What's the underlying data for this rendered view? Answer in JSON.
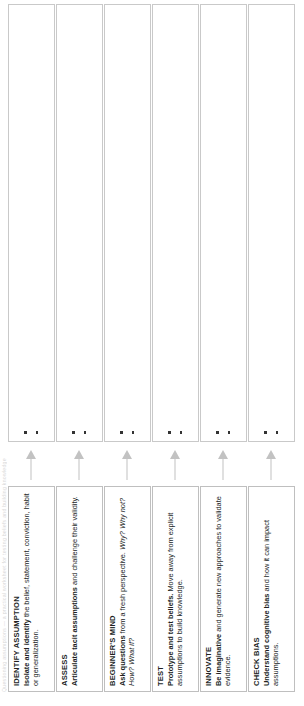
{
  "document": {
    "running_head": "Questioning assumptions — a practical worksheet for testing beliefs and building knowledge",
    "orientation_note": "rotated"
  },
  "steps": [
    {
      "id": "identify-assumption",
      "title": "IDENTIFY ASSUMPTION",
      "lead": "Isolate and identify",
      "body": " the belief, statement, conviction, habit or generalization.",
      "italic": "",
      "marker_count": 2
    },
    {
      "id": "assess",
      "title": "ASSESS",
      "lead": "Articulate tacit assumptions",
      "body": " and challenge their validity.",
      "italic": "",
      "marker_count": 2
    },
    {
      "id": "beginners-mind",
      "title": "BEGINNER'S MIND",
      "lead": "Ask questions",
      "body": " from a fresh perspective.",
      "italic": "Why? Why not? How? What if?",
      "marker_count": 2
    },
    {
      "id": "test",
      "title": "TEST",
      "lead": "Prototype and test beliefs.",
      "body": " Move away from explicit assumptions to build knowledge.",
      "italic": "",
      "marker_count": 2
    },
    {
      "id": "innovate",
      "title": "INNOVATE",
      "lead": "Be imaginative",
      "body": " and generate new approaches to validate evidence.",
      "italic": "",
      "marker_count": 2
    },
    {
      "id": "check-bias",
      "title": "CHECK BIAS",
      "lead": "Understand cognitive bias",
      "body": " and how it can impact assumptions.",
      "italic": "",
      "marker_count": 2
    }
  ],
  "colors": {
    "text": "#221f1f",
    "card_border": "#bfbfbf",
    "box_border": "#c9c9c9",
    "arrow": "#c2c2c2",
    "marker": "#333333",
    "running_head": "#d9d9d9",
    "background": "#ffffff"
  }
}
